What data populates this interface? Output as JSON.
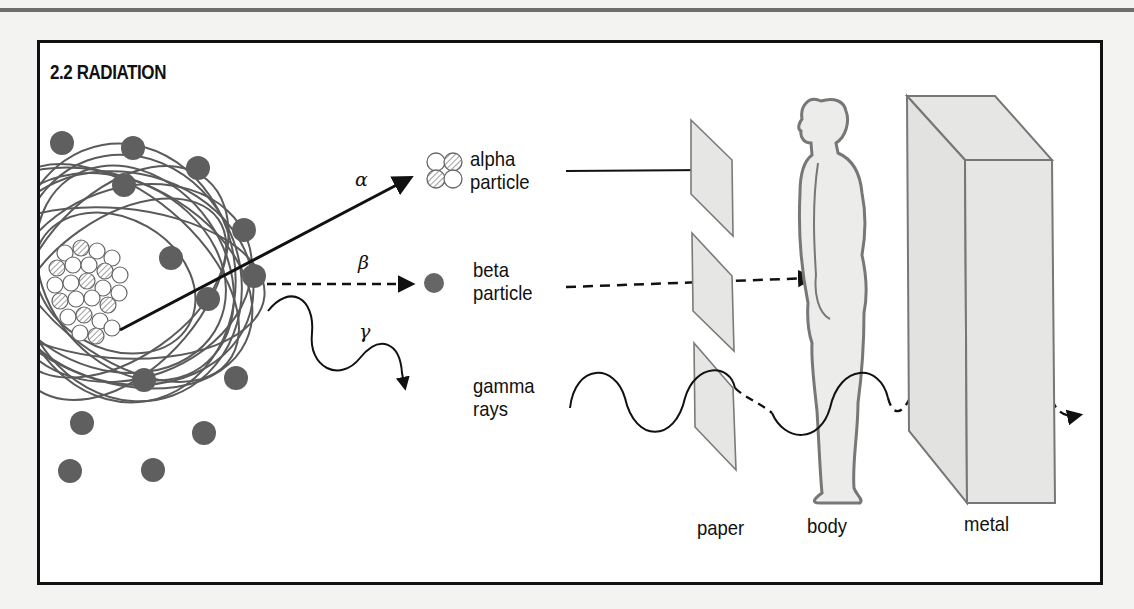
{
  "figure": {
    "title": "2.2 RADIATION",
    "radiation_types": [
      {
        "symbol": "α",
        "label_line1": "alpha",
        "label_line2": "particle",
        "stopped_by": "paper"
      },
      {
        "symbol": "β",
        "label_line1": "beta",
        "label_line2": "particle",
        "stopped_by": "body"
      },
      {
        "symbol": "γ",
        "label_line1": "gamma",
        "label_line2": "rays",
        "stopped_by": "none"
      }
    ],
    "barriers": [
      {
        "label": "paper"
      },
      {
        "label": "body"
      },
      {
        "label": "metal"
      }
    ],
    "colors": {
      "frame": "#111111",
      "electron": "#5f5f5f",
      "barrier_fill": "#e6e6e4",
      "barrier_stroke": "#7a7a7a",
      "page_background": "#f3f3f1"
    }
  }
}
